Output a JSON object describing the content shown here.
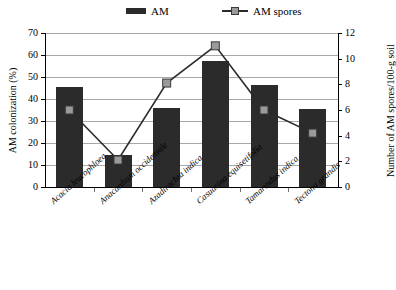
{
  "chart_data": {
    "type": "bar",
    "title": "",
    "subtitle": "",
    "categories": [
      "Acacia leucophloea",
      "Anacardium occidentale",
      "Azadirachta indica",
      "Casuarina equisetifolia",
      "Tamarindus indica",
      "Tectona grandis"
    ],
    "series": [
      {
        "name": "AM",
        "type": "bar",
        "axis": "left",
        "unit": "%",
        "color": "#2b2b2b",
        "values": [
          45.5,
          14.5,
          36.0,
          57.5,
          46.5,
          35.5
        ]
      },
      {
        "name": "AM spores",
        "type": "line",
        "axis": "right",
        "unit": "spores/100-g soil",
        "color": "#2b2b2b",
        "marker_color": "#9a9a9a",
        "values": [
          6.0,
          2.1,
          8.1,
          11.0,
          6.0,
          4.2
        ]
      }
    ],
    "xlabel": "",
    "ylabel": "AM colonization (%)",
    "y2label": "Number of AM spores/100-g soil",
    "ylim": [
      0,
      70
    ],
    "y2lim": [
      0,
      12
    ],
    "yticks": [
      0,
      10,
      20,
      30,
      40,
      50,
      60,
      70
    ],
    "y2ticks": [
      0,
      2,
      4,
      6,
      8,
      10,
      12
    ],
    "grid": "horizontal",
    "legend_position": "top-center",
    "legend": [
      "AM",
      "AM spores"
    ]
  },
  "legend": {
    "am_label": "AM",
    "spores_label": "AM spores"
  },
  "axes": {
    "left_title": "AM colonization (%)",
    "right_title": "Number of AM spores/100-g soil",
    "left_ticks": [
      "70",
      "60",
      "50",
      "40",
      "30",
      "20",
      "10",
      "0"
    ],
    "right_ticks": [
      "12",
      "10",
      "8",
      "6",
      "4",
      "2",
      "0"
    ]
  },
  "categories": [
    "Acacia leucophloea",
    "Anacardium occidentale",
    "Azadirachta indica",
    "Casuarina equisetifolia",
    "Tamarindus indica",
    "Tectona grandis"
  ]
}
